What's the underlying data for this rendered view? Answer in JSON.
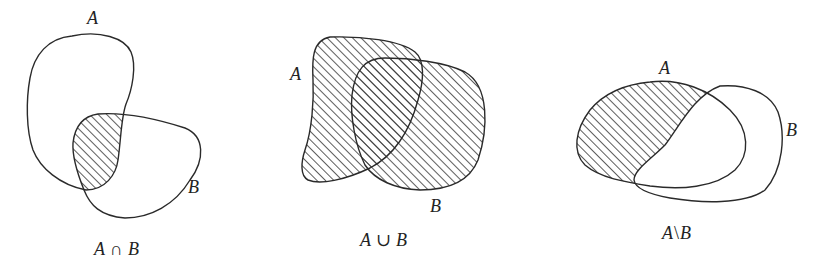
{
  "diagrams": [
    {
      "operation": "intersection",
      "set_a_label": "A",
      "set_b_label": "B",
      "caption_a": "A",
      "caption_op": "∩",
      "caption_b": "B",
      "shaded_region": "A ∩ B"
    },
    {
      "operation": "union",
      "set_a_label": "A",
      "set_b_label": "B",
      "caption_a": "A",
      "caption_op": "∪",
      "caption_b": "B",
      "shaded_region": "A ∪ B"
    },
    {
      "operation": "difference",
      "set_a_label": "A",
      "set_b_label": "B",
      "caption_a": "A",
      "caption_op": "\\",
      "caption_b": "B",
      "shaded_region": "A \\ B"
    }
  ],
  "style": {
    "stroke_color": "#2a2a2a",
    "hatch_color": "#333333",
    "background": "#ffffff"
  }
}
